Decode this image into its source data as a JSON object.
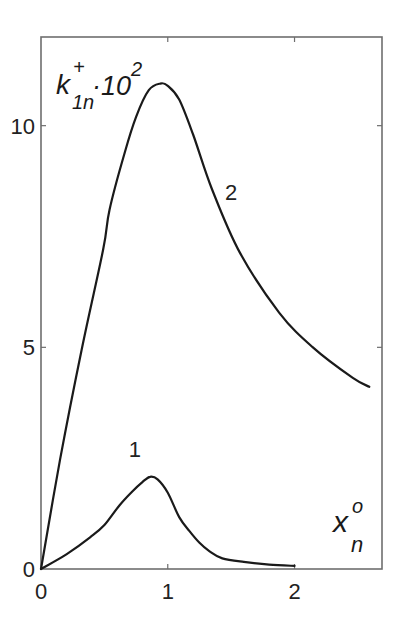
{
  "chart_data": {
    "type": "line",
    "title": "",
    "xlabel": "x_n^o",
    "ylabel": "k_1n^+ · 10^2",
    "xlabel_parts": {
      "base": "x",
      "sup": "o",
      "sub": "n"
    },
    "ylabel_parts": {
      "base": "k",
      "sup": "+",
      "sub": "1n",
      "factor": "·10",
      "factor_sup": "2"
    },
    "xlim": [
      0,
      2.69
    ],
    "ylim": [
      0,
      12
    ],
    "xticks": [
      0,
      1,
      2
    ],
    "xtick_labels": [
      "0",
      "1",
      "2"
    ],
    "yticks": [
      0,
      5,
      10
    ],
    "ytick_labels": [
      "0",
      "5",
      "10"
    ],
    "grid": false,
    "legend": "inline curve labels",
    "series": [
      {
        "name": "1",
        "label_pos": {
          "x": 0.74,
          "y": 2.7
        },
        "x": [
          0,
          0.2,
          0.39,
          0.5,
          0.62,
          0.72,
          0.8,
          0.86,
          0.92,
          1.0,
          1.09,
          1.17,
          1.25,
          1.33,
          1.43,
          1.6,
          1.8,
          2.0
        ],
        "y": [
          0,
          0.33,
          0.72,
          0.99,
          1.44,
          1.75,
          1.96,
          2.08,
          2.02,
          1.72,
          1.17,
          0.86,
          0.59,
          0.4,
          0.24,
          0.16,
          0.1,
          0.07
        ]
      },
      {
        "name": "2",
        "label_pos": {
          "x": 1.5,
          "y": 8.5
        },
        "x": [
          0,
          0.15,
          0.32,
          0.49,
          0.54,
          0.66,
          0.75,
          0.85,
          0.94,
          1.0,
          1.09,
          1.2,
          1.35,
          1.57,
          1.88,
          2.14,
          2.46,
          2.59
        ],
        "y": [
          0,
          2.46,
          4.94,
          7.2,
          8.1,
          9.39,
          10.2,
          10.8,
          10.95,
          10.9,
          10.59,
          9.8,
          8.56,
          7.13,
          5.78,
          5.01,
          4.31,
          4.11
        ]
      }
    ]
  },
  "style": {
    "line_color": "#1a1a1a",
    "frame_color": "#6e6e6e",
    "text_color": "#222222"
  }
}
